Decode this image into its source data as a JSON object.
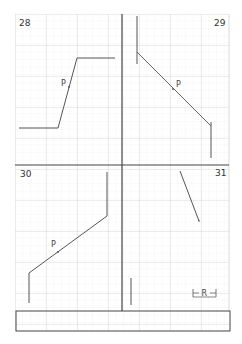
{
  "sheet": {
    "title": "Geometry construction exercises",
    "colors": {
      "background": "#ffffff",
      "minor_grid": "#ececec",
      "major_grid": "#cfcfcf",
      "divider": "#444444",
      "drawing_line": "#555555"
    }
  },
  "panels": [
    {
      "number": "28",
      "point_label": "P"
    },
    {
      "number": "29",
      "point_label": "P"
    },
    {
      "number": "30",
      "point_label": "P"
    },
    {
      "number": "31"
    }
  ],
  "dimension": {
    "label": "R"
  },
  "answer_box": {
    "label": ""
  }
}
